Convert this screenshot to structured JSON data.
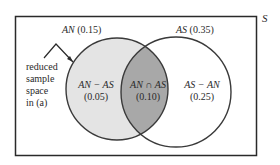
{
  "universe": {
    "label": "S"
  },
  "sets": {
    "AN": {
      "name": "AN",
      "prob": "(0.15)",
      "fill": "#e4e4e4"
    },
    "AS": {
      "name": "AS",
      "prob": "(0.35)",
      "fill": "#ffffff"
    }
  },
  "regions": {
    "an_minus_as": {
      "expr": "AN − AS",
      "prob": "(0.05)"
    },
    "an_cap_as": {
      "expr": "AN ∩ AS",
      "prob": "(0.10)",
      "fill": "#a8a8a8"
    },
    "as_minus_an": {
      "expr": "AS − AN",
      "prob": "(0.25)"
    }
  },
  "annotation": {
    "lines": [
      "reduced",
      "sample",
      "space",
      "in (a)"
    ]
  },
  "colors": {
    "stroke": "#3a3a3a",
    "frame": "#2a2a2a",
    "an_fill": "#e4e4e4",
    "intersection_fill": "#a8a8a8"
  }
}
